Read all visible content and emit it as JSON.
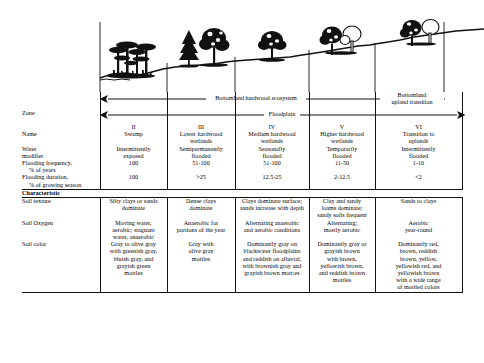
{
  "figure": {
    "title_label": "Bottomland hardwood ecosystem profile",
    "ecosystem_span_label": "Bottomland hardwood ecosystem",
    "floodplain_span_label": "Floodplain",
    "upland_span_label": "Bottomland\nupland transition",
    "upland_span_line1": "Bottomland",
    "upland_span_line2": "upland transition"
  },
  "row_labels": {
    "zone": "Zone",
    "name": "Name",
    "water_modifier_l1": "Water",
    "water_modifier_l2": "modifier",
    "flood_freq_l1": "Flooding frequency,",
    "flood_freq_l2": "% of years",
    "flood_dur_l1": "Flooding duration,",
    "flood_dur_l2": "% of growing season",
    "characteristic": "Characteristic",
    "soil_texture": "Soil texture",
    "soil_oxygen": "Soil Oxygen",
    "soil_color": "Soil color"
  },
  "columns": [
    {
      "zone": "II",
      "name": "Swamp",
      "water_modifier": "Intermittently\nexposed",
      "flooding_frequency": "100",
      "flooding_duration": "100",
      "soil_texture": "Silty clays or sands\ndominate",
      "soil_oxygen": "Moving water,\naerobic; stagnant\nwater, anaerobic",
      "soil_color": "Gray to olive gray\nwith greenish gray,\nbluish gray, and\ngrayish green\nmottles"
    },
    {
      "zone": "III",
      "name": "Lower hardwood\nwetlands",
      "water_modifier": "Semipermanently\nflooded",
      "flooding_frequency": "51-100",
      "flooding_duration": ">25",
      "soil_texture": "Dense clays\ndominate",
      "soil_oxygen": "Anaerobic for\nportions of the year",
      "soil_color": "Gray with\nolive gray\nmottles"
    },
    {
      "zone": "IV",
      "name": "Medium hardwood\nwetlands",
      "water_modifier": "Seasonally\nflooded",
      "flooding_frequency": "51-100",
      "flooding_duration": "12.5-25",
      "soil_texture": "Clays dominate surface;\nsands increase with depth",
      "soil_oxygen": "Alternating anaerobic\nand aerobic conditions",
      "soil_color": "Dominantly gray on\nblackwater floodplains\nand reddish on alluvial,\nwith brownish gray and\ngrayish brown mott;es"
    },
    {
      "zone": "V",
      "name": "Higher hardwood\nwetlands",
      "water_modifier": "Temporarily\nflooded",
      "flooding_frequency": "11-50",
      "flooding_duration": "2-12.5",
      "soil_texture": "Clay and sandy\nloams dominate;\nsandy soils frequent",
      "soil_oxygen": "Alternating;\nmostly aerobic",
      "soil_color": "Dominantly gray or\ngrayish brown\nwith brown,\nyellowish brown,\nand reddish brown\nmottles"
    },
    {
      "zone": "VI",
      "name": "Transition to\nuplands",
      "water_modifier": "Intermittently\nflooded",
      "flooding_frequency": "1-10",
      "flooding_duration": "<2",
      "soil_texture": "Sands to clays",
      "soil_oxygen": "Aerobic\nyear-round",
      "soil_color": "Dominantly red,\nbrown, reddish\nbrown, yellow,\nyellowish red, and\nyellowish brown\nwith a wide range\nof mottled colors"
    }
  ],
  "colors": {
    "ink": "#111111",
    "paper": "#ffffff"
  }
}
